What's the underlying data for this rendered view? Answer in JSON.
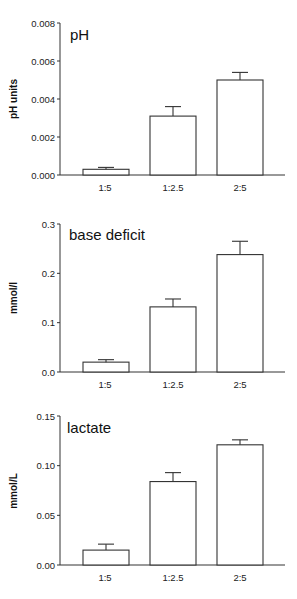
{
  "chart_data": [
    {
      "type": "bar",
      "title": "pH",
      "xlabel": "",
      "ylabel": "pH units",
      "categories": [
        "1:5",
        "1:2.5",
        "2:5"
      ],
      "values": [
        0.0003,
        0.0031,
        0.005
      ],
      "error_upper": [
        0.0004,
        0.0036,
        0.0054
      ],
      "ylim": [
        0,
        0.008
      ],
      "yticks": [
        "0.000",
        "0.002",
        "0.004",
        "0.006",
        "0.008"
      ],
      "ytick_values": [
        0,
        0.002,
        0.004,
        0.006,
        0.008
      ],
      "grid": false,
      "legend": null,
      "bar_fill": "#ffffff",
      "bar_stroke": "#333333"
    },
    {
      "type": "bar",
      "title": "base deficit",
      "xlabel": "",
      "ylabel": "mmol/l",
      "categories": [
        "1:5",
        "1:2.5",
        "2:5"
      ],
      "values": [
        0.02,
        0.132,
        0.238
      ],
      "error_upper": [
        0.025,
        0.148,
        0.265
      ],
      "ylim": [
        0,
        0.3
      ],
      "yticks": [
        "0.0",
        "0.1",
        "0.2",
        "0.3"
      ],
      "ytick_values": [
        0,
        0.1,
        0.2,
        0.3
      ],
      "grid": false,
      "legend": null,
      "bar_fill": "#ffffff",
      "bar_stroke": "#333333"
    },
    {
      "type": "bar",
      "title": "lactate",
      "xlabel": "",
      "ylabel": "mmol/L",
      "categories": [
        "1:5",
        "1:2.5",
        "2:5"
      ],
      "values": [
        0.015,
        0.084,
        0.121
      ],
      "error_upper": [
        0.021,
        0.093,
        0.126
      ],
      "ylim": [
        0,
        0.15
      ],
      "yticks": [
        "0.00",
        "0.05",
        "0.10",
        "0.15"
      ],
      "ytick_values": [
        0,
        0.05,
        0.1,
        0.15
      ],
      "grid": false,
      "legend": null,
      "bar_fill": "#ffffff",
      "bar_stroke": "#333333"
    }
  ]
}
